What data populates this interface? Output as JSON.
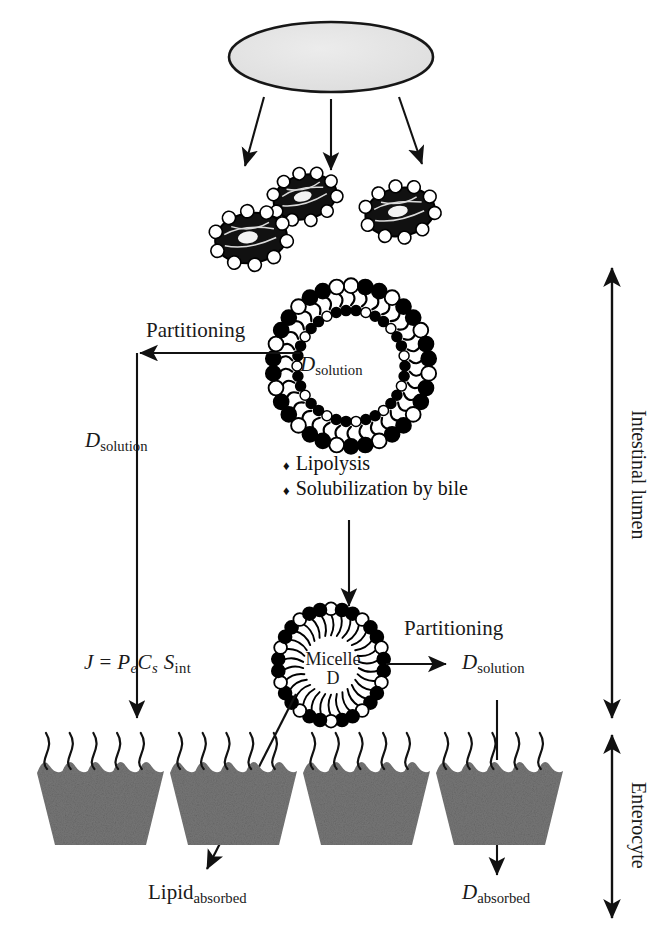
{
  "figure": {
    "type": "diagram",
    "colors": {
      "stroke": "#111111",
      "enterocyte_fill": "#777777",
      "droplet_fill": "#e0e0e0",
      "background": "#ffffff",
      "head_filled": "#000000",
      "head_open": "#ffffff"
    }
  },
  "compartments": {
    "lumen_label": "Intestinal lumen",
    "enterocyte_label": "Enterocyte"
  },
  "nodes": {
    "formulation_droplet": {
      "name": "lipid formulation droplet"
    },
    "emulsion_droplets": {
      "count": 3,
      "name": "coarse emulsion droplets"
    },
    "vesicle": {
      "label_main": "D",
      "label_sub": "solution"
    },
    "micelle": {
      "label_line1": "Micelle",
      "label_line2": "D"
    },
    "enterocytes": {
      "count": 4
    }
  },
  "labels": {
    "partitioning_top": "Partitioning",
    "partitioning_mid": "Partitioning",
    "d_solution_left_main": "D",
    "d_solution_left_sub": "solution",
    "d_solution_right_main": "D",
    "d_solution_right_sub": "solution",
    "lipid_absorbed_main": "Lipid",
    "lipid_absorbed_sub": "absorbed",
    "d_absorbed_main": "D",
    "d_absorbed_sub": "absorbed"
  },
  "equation": {
    "J": "J",
    "eq": "=",
    "P": "P",
    "P_sub": "e",
    "C": "C",
    "C_sub": "s",
    "S": "S",
    "S_sub": "int",
    "full": "J = Pe Cs Sint"
  },
  "processes": {
    "bullet_char": "♦",
    "items": [
      "Lipolysis",
      "Solubilization by bile"
    ]
  }
}
